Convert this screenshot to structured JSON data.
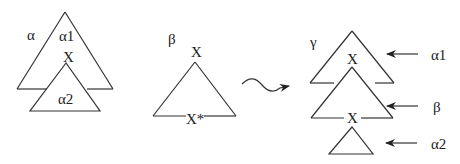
{
  "diagram": {
    "type": "tree-adjunction",
    "colors": {
      "line": "#333333",
      "text": "#222222",
      "background": "#ffffff"
    },
    "alpha_tree": {
      "name_label": "α",
      "upper_label": "α1",
      "node_label": "X",
      "lower_label": "α2"
    },
    "beta_tree": {
      "name_label": "β",
      "root_label": "X",
      "foot_label": "X*"
    },
    "operation": {
      "arrow_icon": "squiggle-arrow-icon"
    },
    "gamma_tree": {
      "name_label": "γ",
      "upper_node_label": "X",
      "lower_node_label": "X",
      "annotations": [
        {
          "label": "α1"
        },
        {
          "label": "β"
        },
        {
          "label": "α2"
        }
      ]
    }
  }
}
